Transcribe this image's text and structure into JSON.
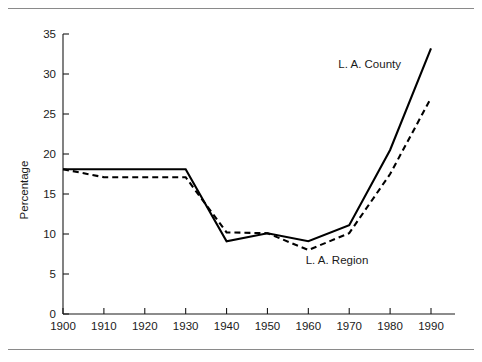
{
  "figure": {
    "background_color": "#ffffff",
    "rule_color": "#8a8a8a",
    "line_color": "#000000"
  },
  "chart_data": {
    "type": "line",
    "title": "",
    "subtitle": "",
    "xlabel": "",
    "ylabel": "Percentage",
    "xlim": [
      1900,
      1990
    ],
    "ylim": [
      0,
      35
    ],
    "grid": false,
    "legend_position": "inline-annotation",
    "x": [
      1900,
      1910,
      1920,
      1930,
      1940,
      1950,
      1960,
      1970,
      1980,
      1990
    ],
    "xticklabels": [
      "1900",
      "1910",
      "1920",
      "1930",
      "1940",
      "1950",
      "1960",
      "1970",
      "1980",
      "1990"
    ],
    "yticks": [
      0,
      5,
      10,
      15,
      20,
      25,
      30,
      35
    ],
    "yticklabels": [
      "0",
      "5",
      "10",
      "15",
      "20",
      "25",
      "30",
      "35"
    ],
    "series": [
      {
        "name": "L. A. County",
        "style": "solid",
        "values": [
          18.1,
          18.1,
          18.1,
          18.1,
          9.1,
          10.1,
          9.1,
          11.1,
          20.5,
          33.2
        ],
        "label_text": "L. A. County"
      },
      {
        "name": "L. A. Region",
        "style": "dashed",
        "values": [
          18.1,
          17.1,
          17.1,
          17.1,
          10.2,
          10.1,
          8.0,
          10.1,
          17.5,
          27.0
        ],
        "label_text": "L. A. Region"
      }
    ],
    "annotations": [
      {
        "text": "L. A. County",
        "x": 1975,
        "y": 30.8
      },
      {
        "text": "L. A. Region",
        "x": 1967,
        "y": 6.2
      }
    ]
  }
}
